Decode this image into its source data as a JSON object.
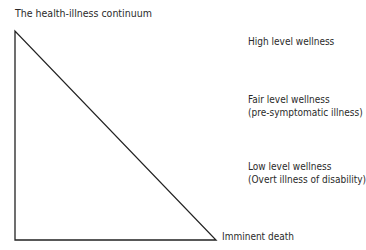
{
  "title": "The health-illness continuum",
  "labels": [
    {
      "line1": "High level wellness",
      "line2": ""
    },
    {
      "line1": "Fair level wellness",
      "line2": "(pre-symptomatic illness)"
    },
    {
      "line1": "Low level wellness",
      "line2": "(Overt illness of disability)"
    },
    {
      "line1": "Imminent death",
      "line2": ""
    }
  ]
}
